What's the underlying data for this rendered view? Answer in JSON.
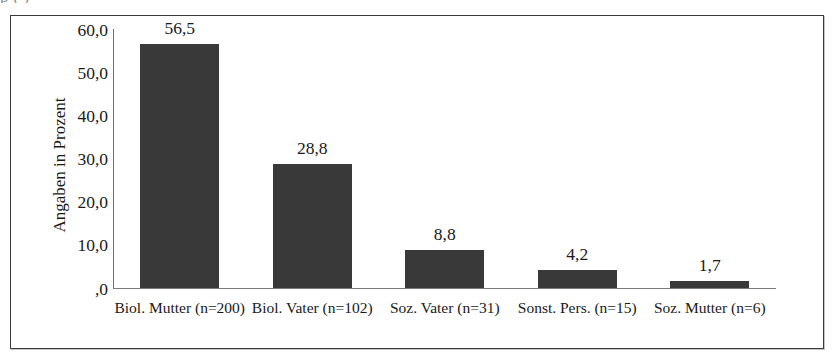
{
  "figure": {
    "title_remnant": "p            (            )",
    "frame_color": "#3b3b3b",
    "background": "#ffffff"
  },
  "chart_data": {
    "type": "bar",
    "title": "",
    "xlabel": "",
    "ylabel": "Angaben in Prozent",
    "categories": [
      "Biol. Mutter (n=200)",
      "Biol. Vater (n=102)",
      "Soz. Vater (n=31)",
      "Sonst. Pers. (n=15)",
      "Soz. Mutter (n=6)"
    ],
    "values": [
      56.5,
      28.8,
      8.8,
      4.2,
      1.7
    ],
    "value_labels": [
      "56,5",
      "28,8",
      "8,8",
      "4,2",
      "1,7"
    ],
    "ylim": [
      0,
      60
    ],
    "yticks": [
      0,
      10,
      20,
      30,
      40,
      50,
      60
    ],
    "ytick_labels": [
      ",0",
      "10,0",
      "20,0",
      "30,0",
      "40,0",
      "50,0",
      "60,0"
    ],
    "grid": false,
    "legend": false,
    "bar_color": "#393939",
    "axis_color": "#7a7a7a",
    "series_name": "Angaben in Prozent"
  }
}
